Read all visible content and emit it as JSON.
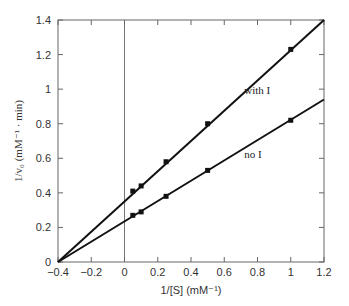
{
  "chart_data": {
    "type": "line",
    "title": "",
    "xlabel": "1/[S] (mM⁻¹)",
    "ylabel": "1/v₀ (mM⁻¹ · min)",
    "xlim": [
      -0.4,
      1.2
    ],
    "ylim": [
      0,
      1.4
    ],
    "xticks": [
      "-0.4",
      "-0.2",
      "0",
      "0.2",
      "0.4",
      "0.6",
      "0.8",
      "1",
      "1.2"
    ],
    "yticks": [
      "0",
      "0.2",
      "0.4",
      "0.6",
      "0.8",
      "1",
      "1.2",
      "1.4"
    ],
    "grid": false,
    "legend": "inline labels",
    "series": [
      {
        "name": "with I",
        "x": [
          0.05,
          0.1,
          0.25,
          0.5,
          1.0
        ],
        "values": [
          0.41,
          0.44,
          0.58,
          0.8,
          1.23
        ],
        "fit_line": {
          "x": [
            -0.4,
            1.2
          ],
          "y": [
            0,
            1.4
          ]
        }
      },
      {
        "name": "no I",
        "x": [
          0.05,
          0.1,
          0.25,
          0.5,
          1.0
        ],
        "values": [
          0.27,
          0.29,
          0.38,
          0.53,
          0.82
        ],
        "fit_line": {
          "x": [
            -0.4,
            1.2
          ],
          "y": [
            0,
            0.94
          ]
        }
      }
    ],
    "annotations": [
      {
        "text": "with I",
        "x": 0.72,
        "y": 0.97
      },
      {
        "text": "no I",
        "x": 0.72,
        "y": 0.6
      }
    ],
    "reference_lines": [
      {
        "orientation": "vertical",
        "x": 0
      }
    ]
  },
  "labels": {
    "xlabel": "1/[S] (mM⁻¹)",
    "ylabel": "1/v₀ (mM⁻¹ · min)",
    "with_i": "with I",
    "no_i": "no I"
  },
  "colors": {
    "line": "#111111",
    "axis": "#555555",
    "text": "#333333"
  }
}
